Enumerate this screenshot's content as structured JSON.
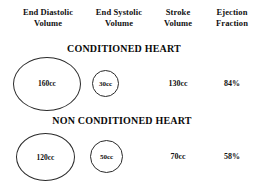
{
  "figure": {
    "background_color": "#ffffff",
    "line_color": "#2a2a2a",
    "text_color": "#111111"
  },
  "columns": [
    {
      "key": "end_diastolic_volume",
      "line1": "End Diastolic",
      "line2": "Volume"
    },
    {
      "key": "end_systolic_volume",
      "line1": "End Systolic",
      "line2": "Volume"
    },
    {
      "key": "stroke_volume",
      "line1": "Stroke",
      "line2": "Volume"
    },
    {
      "key": "ejection_fraction",
      "line1": "Ejection",
      "line2": "Fraction"
    }
  ],
  "sections": [
    {
      "key": "conditioned",
      "title": "CONDITIONED HEART",
      "end_diastolic_volume": "160cc",
      "end_systolic_volume": "30cc",
      "stroke_volume": "130cc",
      "ejection_fraction": "84%"
    },
    {
      "key": "non_conditioned",
      "title": "NON CONDITIONED HEART",
      "end_diastolic_volume": "120cc",
      "end_systolic_volume": "50cc",
      "stroke_volume": "70cc",
      "ejection_fraction": "58%"
    }
  ],
  "chart_data": {
    "type": "table",
    "title": "",
    "columns": [
      "End Diastolic Volume",
      "End Systolic Volume",
      "Stroke Volume",
      "Ejection Fraction"
    ],
    "rows": [
      {
        "label": "CONDITIONED HEART",
        "values": [
          "160cc",
          "30cc",
          "130cc",
          "84%"
        ],
        "numeric": [
          160,
          30,
          130,
          84
        ],
        "units": [
          "cc",
          "cc",
          "cc",
          "%"
        ],
        "circle_diameters_px": [
          68,
          27,
          null,
          null
        ]
      },
      {
        "label": "NON CONDITIONED HEART",
        "values": [
          "120cc",
          "50cc",
          "70cc",
          "58%"
        ],
        "numeric": [
          120,
          50,
          70,
          58
        ],
        "units": [
          "cc",
          "cc",
          "cc",
          "%"
        ],
        "circle_diameters_px": [
          59,
          33,
          null,
          null
        ]
      }
    ],
    "encoding": "First two columns encoded as circles whose area scales with volume; last two columns shown as plain bold text.",
    "legend": "none",
    "grid": false
  }
}
